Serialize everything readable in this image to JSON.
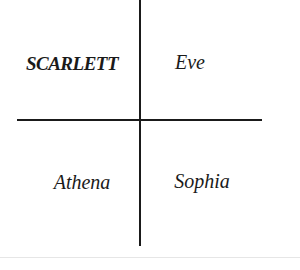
{
  "diagram": {
    "type": "quadrant",
    "cells": [
      {
        "position": "top-left",
        "label": "SCARLETT",
        "bold": true
      },
      {
        "position": "top-right",
        "label": "Eve",
        "bold": false
      },
      {
        "position": "bottom-left",
        "label": "Athena",
        "bold": false
      },
      {
        "position": "bottom-right",
        "label": "Sophia",
        "bold": false
      }
    ],
    "colors": {
      "line": "#1a1a1a",
      "text": "#1a1a1a",
      "background": "#ffffff"
    }
  }
}
